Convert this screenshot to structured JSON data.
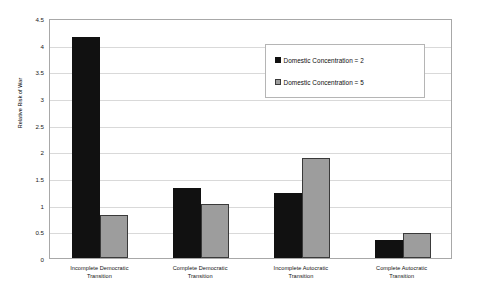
{
  "chart_data": {
    "type": "bar",
    "title": "",
    "subtitle": "",
    "xlabel": "",
    "ylabel": "Relative Risk of War",
    "ylim": [
      0,
      4.5
    ],
    "ytick_step": 0.5,
    "yticks": [
      "0",
      "0.5",
      "1",
      "1.5",
      "2",
      "2.5",
      "3",
      "3.5",
      "4",
      "4.5"
    ],
    "grid": true,
    "legend_position": "top-right",
    "categories": [
      "Incomplete Democratic Transition",
      "Complete Democratic Transition",
      "Incomplete Autocratic Transition",
      "Complete Autocratic Transition"
    ],
    "series": [
      {
        "name": "Domestic Concentration = 2",
        "color": "#111111",
        "values": [
          4.15,
          1.32,
          1.22,
          0.34
        ]
      },
      {
        "name": "Domestic Concentration = 5",
        "color": "#9d9d9d",
        "values": [
          0.8,
          1.01,
          1.88,
          0.47
        ]
      }
    ]
  },
  "legend": {
    "entries": [
      "Domestic Concentration = 2",
      "Domestic Concentration = 5"
    ]
  }
}
